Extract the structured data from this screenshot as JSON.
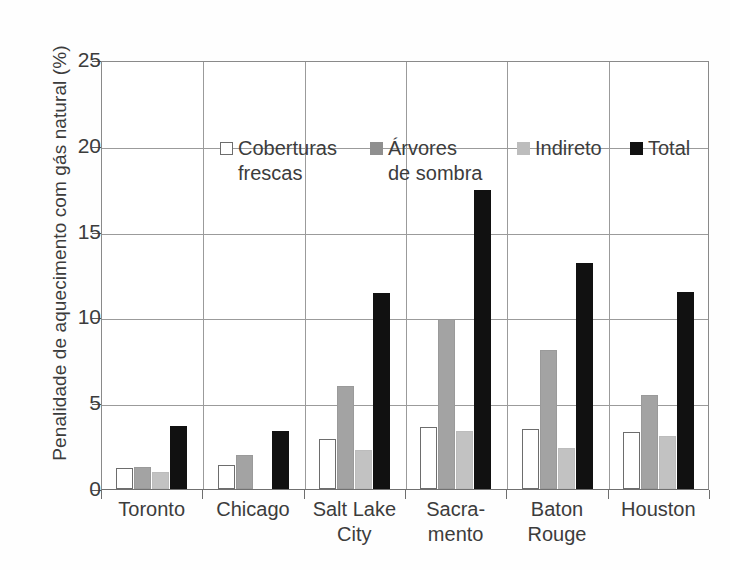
{
  "chart_data": {
    "type": "bar",
    "title": "",
    "xlabel": "",
    "ylabel": "Penalidade de aquecimento com gás natural (%)",
    "ylim": [
      0,
      25
    ],
    "yticks": [
      0,
      5,
      10,
      15,
      20,
      25
    ],
    "ytick_labels": [
      "0",
      "5",
      "10",
      "15",
      "20",
      "25"
    ],
    "grid": true,
    "legend_position": "upper-left-inside",
    "categories": [
      "Toronto",
      "Chicago",
      "Salt Lake\nCity",
      "Sacra-\nmento",
      "Baton\nRouge",
      "Houston"
    ],
    "series": [
      {
        "name": "Coberturas frescas",
        "color": "#ffffff",
        "values": [
          1.2,
          1.4,
          2.9,
          3.6,
          3.5,
          3.3
        ]
      },
      {
        "name": "Árvores de sombra",
        "color": "#8f8f8f",
        "values": [
          1.3,
          2.0,
          6.0,
          9.9,
          8.1,
          5.5
        ]
      },
      {
        "name": "Indireto",
        "color": "#bdbdbd",
        "values": [
          1.0,
          0.0,
          2.3,
          3.4,
          2.4,
          3.1
        ]
      },
      {
        "name": "Total",
        "color": "#111111",
        "values": [
          3.7,
          3.4,
          11.4,
          17.4,
          13.2,
          11.5
        ]
      }
    ]
  },
  "legend": {
    "items": [
      {
        "label": "Coberturas\nfrescas",
        "swatch": "open-square"
      },
      {
        "label": "Árvores\nde sombra",
        "swatch": "dark-gray-square"
      },
      {
        "label": "Indireto",
        "swatch": "light-gray-square"
      },
      {
        "label": "Total",
        "swatch": "black-square"
      }
    ]
  }
}
